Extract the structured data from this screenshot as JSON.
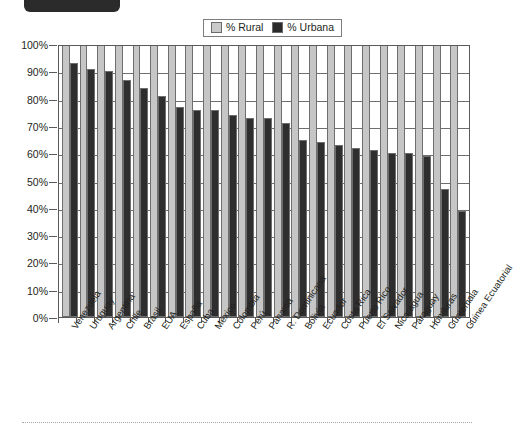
{
  "legend": {
    "items": [
      {
        "label": "% Rural",
        "color": "#c6c6c6",
        "icon": "legend-swatch-rural"
      },
      {
        "label": "% Urbana",
        "color": "#2e2e2e",
        "icon": "legend-swatch-urbana"
      }
    ]
  },
  "credit": "© Heinle/Cengage Learning",
  "chart_data": {
    "type": "bar",
    "title": "",
    "subtitle": "",
    "xlabel": "",
    "ylabel": "",
    "ylim": [
      0,
      100
    ],
    "grid": true,
    "legend_position": "top-center",
    "ytick_labels": [
      "100%",
      "90%",
      "80%",
      "70%",
      "60%",
      "50%",
      "40%",
      "30%",
      "20%",
      "10%",
      "0%"
    ],
    "ytick_values": [
      100,
      90,
      80,
      70,
      60,
      50,
      40,
      30,
      20,
      10,
      0
    ],
    "categories": [
      "Venezuela",
      "Uruguay",
      "Argentina",
      "Chile",
      "Brasil",
      "EUA",
      "España",
      "Cuba",
      "México",
      "Colombia",
      "Perú",
      "Panamá",
      "R. Dominicana",
      "Bolivia",
      "Ecuador",
      "Costa Rica",
      "Puerto Rico",
      "El Salvador",
      "Nicaragua",
      "Paraguay",
      "Honduras",
      "Guatemala",
      "Guinea Ecuatorial"
    ],
    "series": [
      {
        "name": "% Rural",
        "color": "#c6c6c6",
        "values": [
          100,
          100,
          100,
          100,
          100,
          100,
          100,
          100,
          100,
          100,
          100,
          100,
          100,
          100,
          100,
          100,
          100,
          100,
          100,
          100,
          100,
          100,
          100
        ]
      },
      {
        "name": "% Urbana",
        "color": "#2e2e2e",
        "values": [
          93,
          91,
          90,
          87,
          84,
          81,
          77,
          76,
          76,
          74,
          73,
          73,
          71,
          65,
          64,
          63,
          62,
          61,
          60,
          60,
          59,
          47,
          39
        ]
      }
    ]
  }
}
